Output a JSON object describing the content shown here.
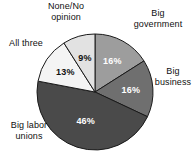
{
  "chart_data": {
    "type": "pie",
    "title": "",
    "subtitle": "",
    "xlabel": "",
    "ylabel": "",
    "legend_position": "none",
    "grid": false,
    "units": "percent",
    "categories": [
      "Big government",
      "Big business",
      "Big labor unions",
      "All three",
      "None/No opinion"
    ],
    "values": [
      16,
      16,
      46,
      13,
      9
    ],
    "value_labels": [
      "16%",
      "16%",
      "46%",
      "13%",
      "9%"
    ],
    "colors": [
      "#9d9d9d",
      "#6f6f6f",
      "#4a4a4a",
      "#f4f4f4",
      "#e2e2e2"
    ],
    "start_angle_deg": 0,
    "direction": "clockwise",
    "slices": [
      {
        "name": "Big government",
        "value": 16,
        "value_label": "16%",
        "color": "#9d9d9d",
        "label_text": "Big\ngovernment",
        "label_position": "top-right",
        "value_text_color": "light"
      },
      {
        "name": "Big business",
        "value": 16,
        "value_label": "16%",
        "color": "#6f6f6f",
        "label_text": "Big\nbusiness",
        "label_position": "right",
        "value_text_color": "light"
      },
      {
        "name": "Big labor unions",
        "value": 46,
        "value_label": "46%",
        "color": "#4a4a4a",
        "label_text": "Big labor\nunions",
        "label_position": "bottom-left",
        "value_text_color": "light"
      },
      {
        "name": "All three",
        "value": 13,
        "value_label": "13%",
        "color": "#f4f4f4",
        "label_text": "All three",
        "label_position": "left",
        "value_text_color": "dark"
      },
      {
        "name": "None/No opinion",
        "value": 9,
        "value_label": "9%",
        "color": "#e2e2e2",
        "label_text": "None/No\nopinion",
        "label_position": "top-left",
        "value_text_color": "dark"
      }
    ]
  },
  "labels": {
    "none_no_opinion": "None/No\nopinion",
    "big_government": "Big\ngovernment",
    "big_business": "Big\nbusiness",
    "all_three": "All three",
    "big_labor_unions": "Big labor\nunions"
  },
  "values": {
    "big_government": "16%",
    "big_business": "16%",
    "big_labor_unions": "46%",
    "all_three": "13%",
    "none_no_opinion": "9%"
  },
  "geometry": {
    "center_x": 95,
    "center_y": 92,
    "radius": 58
  }
}
